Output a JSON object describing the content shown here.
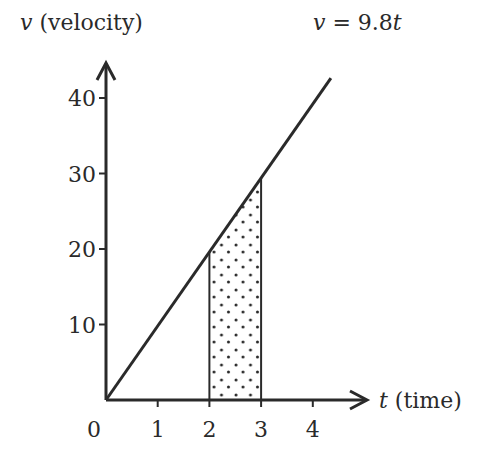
{
  "chart_data": {
    "type": "line",
    "title": "",
    "equation_label": {
      "var": "v",
      "eq": " = 9.8",
      "tvar": "t"
    },
    "xlabel": {
      "var": "t",
      "text": " (time)"
    },
    "ylabel": {
      "var": "v",
      "text": " (velocity)"
    },
    "origin_label": "0",
    "x_ticks": [
      1,
      2,
      3,
      4
    ],
    "y_ticks": [
      10,
      20,
      30,
      40
    ],
    "xlim": [
      0,
      4.6
    ],
    "ylim": [
      0,
      45
    ],
    "grid": false,
    "series": [
      {
        "name": "v = 9.8t",
        "slope": 9.8,
        "x": [
          0,
          4.35
        ],
        "values": [
          0,
          42.63
        ]
      }
    ],
    "shaded_region": {
      "x_start": 2,
      "x_end": 3,
      "pattern": "dotted",
      "description": "area under v = 9.8t between t = 2 and t = 3"
    },
    "colors": {
      "ink": "#2a2a2a",
      "background": "#ffffff"
    }
  }
}
